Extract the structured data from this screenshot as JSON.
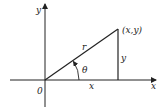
{
  "diagram": {
    "title": "",
    "type": "polar-coordinates-right-triangle",
    "axes": {
      "x_label": "x",
      "y_label": "y",
      "origin_label": "0"
    },
    "point_label": "(x,y)",
    "hypotenuse_label": "r",
    "angle_label": "θ",
    "vertical_leg_label": "y",
    "horizontal_leg_label": "x",
    "stroke_color": "#222222",
    "background": "#ffffff"
  }
}
